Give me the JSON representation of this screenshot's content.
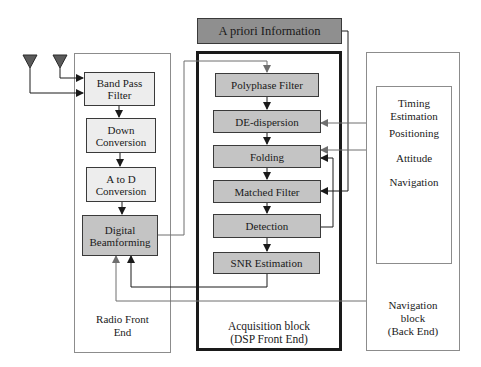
{
  "diagram": {
    "type": "block-diagram"
  },
  "apriori": {
    "label": "A priori Information"
  },
  "radio_front_end": {
    "caption_line1": "Radio Front",
    "caption_line2": "End",
    "blocks": [
      {
        "id": "bpf",
        "line1": "Band Pass",
        "line2": "Filter"
      },
      {
        "id": "down",
        "line1": "Down",
        "line2": "Conversion"
      },
      {
        "id": "adc",
        "line1": "A to D",
        "line2": "Conversion"
      },
      {
        "id": "dbf",
        "line1": "Digital",
        "line2": "Beamforming"
      }
    ],
    "antennas": [
      "antenna-1",
      "antenna-2"
    ]
  },
  "acquisition": {
    "caption_line1": "Acquisition block",
    "caption_line2": "(DSP Front End)",
    "blocks": [
      {
        "id": "poly",
        "label": "Polyphase Filter"
      },
      {
        "id": "dedisp",
        "label": "DE-dispersion"
      },
      {
        "id": "fold",
        "label": "Folding"
      },
      {
        "id": "mf",
        "label": "Matched Filter"
      },
      {
        "id": "det",
        "label": "Detection"
      },
      {
        "id": "snr",
        "label": "SNR Estimation"
      }
    ]
  },
  "navigation": {
    "caption_line1": "Navigation",
    "caption_line2": "block",
    "caption_line3": "(Back End)",
    "items": [
      {
        "line1": "Timing",
        "line2": "Estimation"
      },
      {
        "line1": "Positioning"
      },
      {
        "line1": "Attitude"
      },
      {
        "line1": "Navigation"
      }
    ]
  },
  "colors": {
    "light_block": "#ededed",
    "mid_block": "#c4c4c4",
    "dark_block": "#8f8f8f",
    "wire_dark": "#1a1a1a",
    "wire_gray": "#6e6e6e",
    "frame": "#8c8c8c"
  }
}
